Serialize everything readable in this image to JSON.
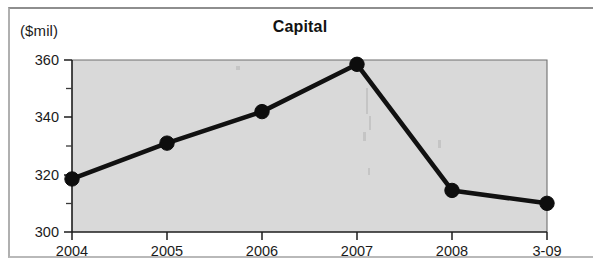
{
  "chart_data": {
    "type": "line",
    "title": "Capital",
    "unit_label": "($mil)",
    "xlabel": "",
    "ylabel": "($mil)",
    "categories": [
      "2004",
      "2005",
      "2006",
      "2007",
      "2008",
      "3-09"
    ],
    "values": [
      318.5,
      331,
      342,
      358.5,
      314.5,
      310
    ],
    "series": [
      {
        "name": "Capital",
        "values": [
          318.5,
          331,
          342,
          358.5,
          314.5,
          310
        ]
      }
    ],
    "ylim": [
      300,
      360
    ],
    "y_ticks_major": [
      "300",
      "320",
      "340",
      "360"
    ],
    "y_tick_major_values": [
      300,
      320,
      340,
      360
    ],
    "y_tick_minor_values": [
      310,
      330,
      350
    ],
    "x_tick_labels": [
      "2004",
      "2005",
      "2006",
      "2007",
      "2008",
      "3-09"
    ],
    "grid": false,
    "legend": "none",
    "marker": "filled-circle",
    "plot_background": "#d9d9d9",
    "line_color": "#111111",
    "marker_color": "#0d0d0d"
  },
  "figure": {
    "title": "Capital",
    "unit_label": "($mil)"
  },
  "axes": {
    "y": {
      "ticks": [
        {
          "label": "360",
          "value": 360
        },
        {
          "label": "340",
          "value": 340
        },
        {
          "label": "320",
          "value": 320
        },
        {
          "label": "300",
          "value": 300
        }
      ]
    },
    "x": {
      "ticks": [
        {
          "label": "2004"
        },
        {
          "label": "2005"
        },
        {
          "label": "2006"
        },
        {
          "label": "2007"
        },
        {
          "label": "2008"
        },
        {
          "label": "3-09"
        }
      ]
    }
  }
}
